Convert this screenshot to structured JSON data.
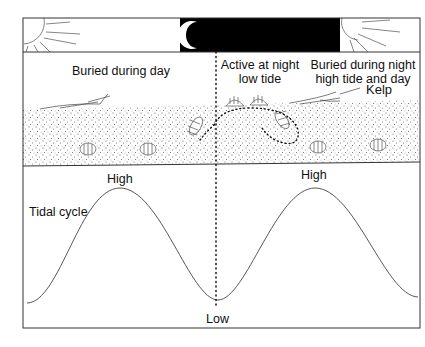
{
  "diagram": {
    "type": "behavior-vs-tidal-cycle",
    "sky": {
      "left": "sun-icon",
      "middle": "moon-crescent-icon",
      "right": "sun-icon",
      "night_band_color": "#000000"
    },
    "labels": {
      "buried_day": "Buried during day",
      "active_night_line1": "Active at night",
      "active_night_line2": "low tide",
      "buried_night_line1": "Buried during night",
      "buried_night_line2": "high tide and day",
      "kelp": "Kelp",
      "tidal_cycle": "Tidal cycle",
      "high_left": "High",
      "high_right": "High",
      "low": "Low"
    },
    "colors": {
      "line": "#333333",
      "sand_dot": "#555555",
      "night": "#000000"
    }
  }
}
